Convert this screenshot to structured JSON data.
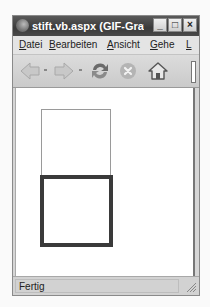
{
  "window": {
    "title": "stift.vb.aspx (GIF-Graf...",
    "controls": {
      "minimize": "_",
      "maximize": "□",
      "close": "×"
    }
  },
  "menubar": {
    "items": [
      {
        "label": "Datei",
        "accel": "D",
        "rest": "atei"
      },
      {
        "label": "Bearbeiten",
        "accel": "B",
        "rest": "earbeiten"
      },
      {
        "label": "Ansicht",
        "accel": "A",
        "rest": "nsicht"
      },
      {
        "label": "Gehe",
        "accel": "G",
        "rest": "ehe"
      },
      {
        "label": "L",
        "accel": "L",
        "rest": ""
      }
    ]
  },
  "toolbar": {
    "buttons": [
      {
        "name": "back",
        "icon": "back-arrow-icon"
      },
      {
        "name": "forward",
        "icon": "forward-arrow-icon"
      },
      {
        "name": "reload",
        "icon": "reload-icon"
      },
      {
        "name": "stop",
        "icon": "stop-icon"
      },
      {
        "name": "home",
        "icon": "home-icon"
      }
    ]
  },
  "content": {
    "shapes": [
      {
        "type": "rectangle",
        "stroke": "thin",
        "color": "#9a9a9a"
      },
      {
        "type": "rectangle",
        "stroke": "thick",
        "color": "#3a3a3a"
      }
    ]
  },
  "statusbar": {
    "text": "Fertig"
  }
}
